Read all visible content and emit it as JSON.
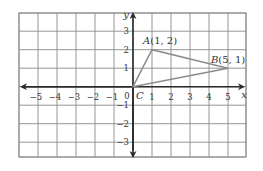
{
  "diagram": {
    "type": "coordinate-plane",
    "grid": {
      "x_min": -6,
      "x_max": 6,
      "y_min": -3,
      "y_max": 4
    },
    "axes": {
      "x_label": "x",
      "y_label": "y"
    },
    "x_ticks": [
      "-5",
      "-4",
      "-3",
      "-2",
      "-1",
      "1",
      "2",
      "3",
      "4",
      "5"
    ],
    "y_ticks": [
      "3",
      "2",
      "1",
      "-1",
      "-2",
      "-3"
    ],
    "origin_label": "0",
    "points": [
      {
        "name": "A",
        "coords": "(1, 2)",
        "x": 1,
        "y": 2
      },
      {
        "name": "B",
        "coords": "(5, 1)",
        "x": 5,
        "y": 1
      },
      {
        "name": "C",
        "coords": "",
        "x": 0,
        "y": 0
      }
    ],
    "shape": "triangle ABC",
    "colors": {
      "grid": "#8a8a8a",
      "axis": "#2a2a2a",
      "triangle": "#8c8c8c"
    }
  }
}
